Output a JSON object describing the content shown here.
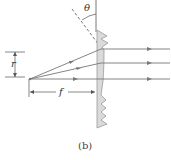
{
  "labels": {
    "theta": "θ",
    "r": "r",
    "f": "f",
    "caption": "(b)"
  },
  "colors": {
    "ray": "#777777",
    "lens_fill": "#d9d9d9",
    "lens_stroke": "#999999",
    "line": "#555555"
  }
}
